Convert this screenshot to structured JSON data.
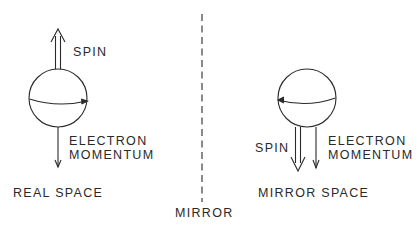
{
  "labels": {
    "real_spin": "SPIN",
    "real_momentum_line1": "ELECTRON",
    "real_momentum_line2": "MOMENTUM",
    "real_space": "REAL SPACE",
    "mirror": "MIRROR",
    "mirror_spin": "SPIN",
    "mirror_momentum_line1": "ELECTRON",
    "mirror_momentum_line2": "MOMENTUM",
    "mirror_space": "MIRROR SPACE"
  },
  "colors": {
    "ink": "#2a2a2a",
    "background": "#ffffff"
  }
}
